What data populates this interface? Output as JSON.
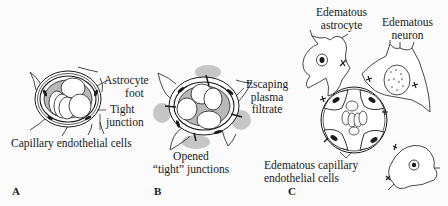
{
  "figure": {
    "panels": [
      {
        "id": "A",
        "letter": "A",
        "title": "Normal capillary",
        "labels": {
          "astrocyte_foot_1": "Astrocyte",
          "astrocyte_foot_2": "foot",
          "tight_junction_1": "Tight",
          "tight_junction_2": "junction",
          "endothelial": "Capillary endothelial cells"
        }
      },
      {
        "id": "B",
        "letter": "B",
        "labels": {
          "escaping_1": "Escaping",
          "escaping_2": "plasma",
          "escaping_3": "filtrate",
          "opened_1": "Opened",
          "opened_2": "“tight” junctions"
        }
      },
      {
        "id": "C",
        "letter": "C",
        "labels": {
          "astrocyte_1": "Edematous",
          "astrocyte_2": "astrocyte",
          "neuron_1": "Edematous",
          "neuron_2": "neuron",
          "capillary_1": "Edematous capillary",
          "capillary_2": "endothelial cells"
        }
      }
    ],
    "colors": {
      "ink": "#1a1a1a",
      "lumen_fill": "#b9b9b9",
      "filtrate": "#bdbdbd",
      "cell_fill": "#ffffff",
      "background": "#fbfbfb"
    }
  }
}
